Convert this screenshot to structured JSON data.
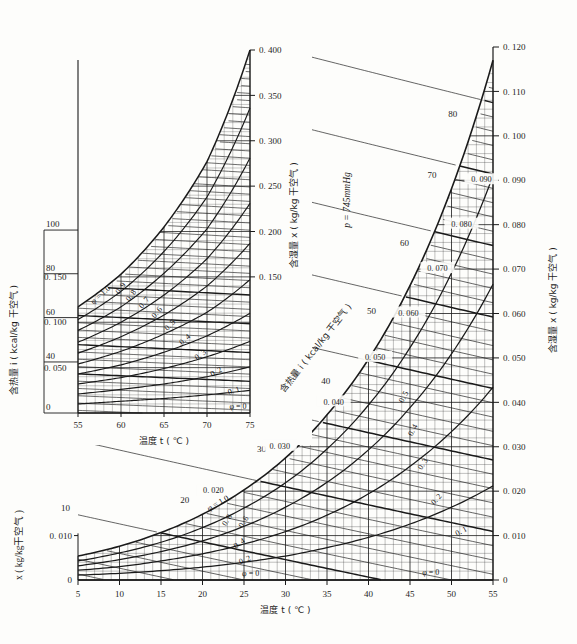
{
  "figure": {
    "kind": "psychrometric-chart",
    "pressure_label": "p = 745mmHg",
    "background": "#fdfdfb",
    "ink": "#1a1a1a"
  },
  "main_chart": {
    "x_axis_label": "温度 t ( ℃ )",
    "left_axis_label": "x ( kg/kg干空气 )",
    "right_axis_label": "含湿量 x ( kg/kg 干空气 )",
    "enthalpy_axis_label": "含热量 i ( kcal/kg 干空气 )",
    "x_ticks": [
      "5",
      "10",
      "15",
      "20",
      "25",
      "30",
      "35",
      "40",
      "45",
      "50",
      "55"
    ],
    "right_ticks": [
      "0",
      "0.010",
      "0.020",
      "0.030",
      "0.040",
      "0.050",
      "0.060",
      "0.070",
      "0.080",
      "0.090",
      "0.100",
      "0.110",
      "0.120"
    ],
    "left_ticks": [
      "0",
      "0.010"
    ],
    "enthalpy_labels": [
      "10",
      "20",
      "30",
      "40",
      "50",
      "60",
      "70",
      "80"
    ],
    "inline_x_labels": [
      "0.020",
      "0.030",
      "0.040",
      "0.050",
      "0.060",
      "0.070",
      "0.080",
      "0.090"
    ],
    "phi_labels": [
      "φ = 1.0",
      "0.8",
      "0.6",
      "0.4",
      "0.2",
      "φ = 0"
    ],
    "phi_right_labels": [
      "0.5",
      "0.4",
      "0.3",
      "0.2",
      "0.1",
      "φ = 0"
    ]
  },
  "inset_chart": {
    "x_axis_label": "温度 t ( ℃ )",
    "left_axis_label": "含热量 i ( kcal/kg 干空气 )",
    "right_axis_label": "含湿量 x ( kg/kg 干空气 )",
    "x_ticks": [
      "55",
      "60",
      "65",
      "70",
      "75"
    ],
    "left_ticks": [
      "0",
      "40",
      "60",
      "80",
      "100"
    ],
    "left_x_ticks": [
      "0.050",
      "0.100",
      "0.150"
    ],
    "right_ticks": [
      "0.150",
      "0.200",
      "0.250",
      "0.300",
      "0.350",
      "0.400"
    ],
    "phi_labels": [
      "φ = 1.0",
      "0.9",
      "0.8",
      "0.7",
      "0.6",
      "0.5",
      "0.4",
      "0.3",
      "0.2",
      "0.1",
      "φ = 0"
    ]
  },
  "chart_data": {
    "type": "line",
    "xlabel": "温度 t ( ℃ )",
    "ylabel": "含湿量 x ( kg/kg 干空气 )",
    "grid": true,
    "legend": "inline-curve-labels",
    "main_panel": {
      "xlim": [
        5,
        55
      ],
      "ylim": [
        0,
        0.12
      ],
      "xticks": [
        5,
        10,
        15,
        20,
        25,
        30,
        35,
        40,
        45,
        50,
        55
      ],
      "yticks": [
        0,
        0.01,
        0.02,
        0.03,
        0.04,
        0.05,
        0.06,
        0.07,
        0.08,
        0.09,
        0.1,
        0.11,
        0.12
      ],
      "series": [
        {
          "name": "φ = 1.0",
          "x": [
            5,
            10,
            15,
            20,
            25,
            30,
            35,
            40,
            45,
            50,
            55
          ],
          "values": [
            0.0054,
            0.0076,
            0.0107,
            0.0148,
            0.0203,
            0.0275,
            0.0372,
            0.0497,
            0.0663,
            0.0881,
            0.117
          ]
        },
        {
          "name": "φ = 0.8",
          "x": [
            5,
            10,
            15,
            20,
            25,
            30,
            35,
            40,
            45,
            50,
            55
          ],
          "values": [
            0.0043,
            0.0061,
            0.0085,
            0.0118,
            0.0162,
            0.0219,
            0.0295,
            0.0394,
            0.0523,
            0.0691,
            0.091
          ]
        },
        {
          "name": "φ = 0.6",
          "x": [
            5,
            10,
            15,
            20,
            25,
            30,
            35,
            40,
            45,
            50,
            55
          ],
          "values": [
            0.0032,
            0.0046,
            0.0064,
            0.0088,
            0.0121,
            0.0164,
            0.022,
            0.0293,
            0.0388,
            0.0509,
            0.0666
          ]
        },
        {
          "name": "φ = 0.4",
          "x": [
            5,
            10,
            15,
            20,
            25,
            30,
            35,
            40,
            45,
            50,
            55
          ],
          "values": [
            0.0022,
            0.003,
            0.0043,
            0.0059,
            0.0081,
            0.0109,
            0.0146,
            0.0194,
            0.0256,
            0.0334,
            0.0434
          ]
        },
        {
          "name": "φ = 0.2",
          "x": [
            5,
            10,
            15,
            20,
            25,
            30,
            35,
            40,
            45,
            50,
            55
          ],
          "values": [
            0.0011,
            0.0015,
            0.0021,
            0.0029,
            0.004,
            0.0054,
            0.0073,
            0.0096,
            0.0126,
            0.0164,
            0.0212
          ]
        },
        {
          "name": "φ = 0",
          "x": [
            5,
            55
          ],
          "values": [
            0,
            0
          ]
        }
      ],
      "enthalpy_lines_kcal_per_kg": [
        10,
        20,
        30,
        40,
        50,
        60,
        70,
        80
      ]
    },
    "inset_panel": {
      "xlim": [
        55,
        75
      ],
      "ylim": [
        0,
        0.4
      ],
      "xticks": [
        55,
        60,
        65,
        70,
        75
      ],
      "yticks_enthalpy": [
        0,
        40,
        60,
        80,
        100
      ],
      "yticks_humidity": [
        0.05,
        0.1,
        0.15,
        0.2,
        0.25,
        0.3,
        0.35,
        0.4
      ],
      "series": [
        {
          "name": "φ = 1.0",
          "x": [
            55,
            60,
            65,
            70,
            75
          ],
          "values": [
            0.117,
            0.153,
            0.205,
            0.277,
            0.4
          ]
        },
        {
          "name": "φ = 0.9",
          "x": [
            55,
            60,
            65,
            70,
            75
          ],
          "values": [
            0.103,
            0.134,
            0.178,
            0.238,
            0.336
          ]
        },
        {
          "name": "φ = 0.8",
          "x": [
            55,
            60,
            65,
            70,
            75
          ],
          "values": [
            0.091,
            0.117,
            0.154,
            0.203,
            0.281
          ]
        },
        {
          "name": "φ = 0.7",
          "x": [
            55,
            60,
            65,
            70,
            75
          ],
          "values": [
            0.078,
            0.1,
            0.13,
            0.17,
            0.231
          ]
        },
        {
          "name": "φ = 0.6",
          "x": [
            55,
            60,
            65,
            70,
            75
          ],
          "values": [
            0.066,
            0.084,
            0.108,
            0.14,
            0.187
          ]
        },
        {
          "name": "φ = 0.5",
          "x": [
            55,
            60,
            65,
            70,
            75
          ],
          "values": [
            0.054,
            0.068,
            0.087,
            0.111,
            0.147
          ]
        },
        {
          "name": "φ = 0.4",
          "x": [
            55,
            60,
            65,
            70,
            75
          ],
          "values": [
            0.043,
            0.053,
            0.067,
            0.085,
            0.11
          ]
        },
        {
          "name": "φ = 0.3",
          "x": [
            55,
            60,
            65,
            70,
            75
          ],
          "values": [
            0.032,
            0.039,
            0.049,
            0.062,
            0.079
          ]
        },
        {
          "name": "φ = 0.2",
          "x": [
            55,
            60,
            65,
            70,
            75
          ],
          "values": [
            0.021,
            0.026,
            0.032,
            0.04,
            0.051
          ]
        },
        {
          "name": "φ = 0.1",
          "x": [
            55,
            60,
            65,
            70,
            75
          ],
          "values": [
            0.01,
            0.013,
            0.016,
            0.02,
            0.025
          ]
        },
        {
          "name": "φ = 0",
          "x": [
            55,
            75
          ],
          "values": [
            0,
            0
          ]
        }
      ],
      "enthalpy_lines_kcal_per_kg": [
        0,
        40,
        60,
        80,
        100
      ]
    }
  }
}
